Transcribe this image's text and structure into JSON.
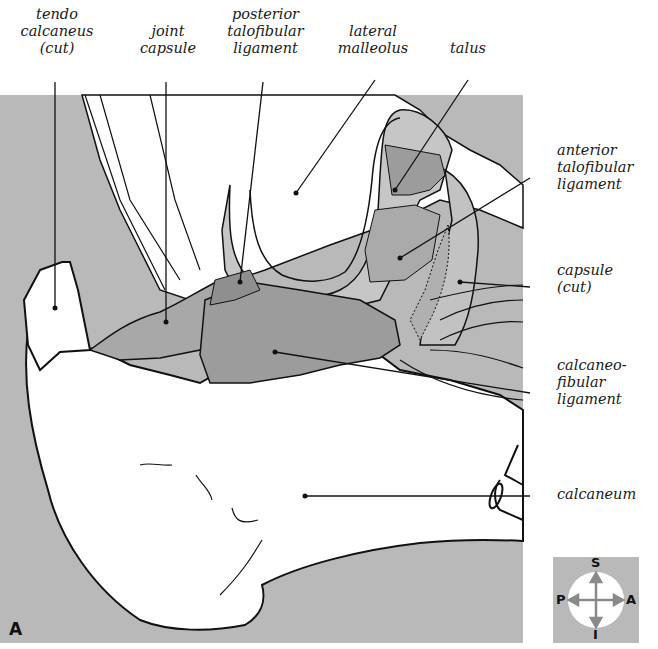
{
  "figure": {
    "panel_letter": "A",
    "background_color": "#b9b9b9",
    "ligament_color": "#9c9c9c",
    "bone_color": "#ffffff",
    "line_color": "#111111"
  },
  "labels": {
    "tendo_calcaneus": [
      "tendo",
      "calcaneus",
      "(cut)"
    ],
    "joint_capsule": [
      "joint",
      "capsule"
    ],
    "posterior_talofibular_ligament": [
      "posterior",
      "talofibular",
      "ligament"
    ],
    "lateral_malleolus": [
      "lateral",
      "malleolus"
    ],
    "talus": [
      "talus"
    ],
    "anterior_talofibular_ligament": [
      "anterior",
      "talofibular",
      "ligament"
    ],
    "capsule_cut": [
      "capsule",
      "(cut)"
    ],
    "calcaneofibular_ligament": [
      "calcaneo-",
      "fibular",
      "ligament"
    ],
    "calcaneum": [
      "calcaneum"
    ]
  },
  "compass": {
    "superior": "S",
    "inferior": "I",
    "posterior": "P",
    "anterior": "A"
  }
}
